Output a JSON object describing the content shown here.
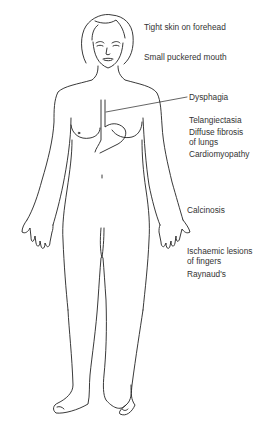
{
  "figure": {
    "line_color": "#222222",
    "background": "#ffffff"
  },
  "labels": [
    {
      "id": "forehead",
      "text": "Tight skin on forehead",
      "x": 144,
      "y": 22
    },
    {
      "id": "mouth",
      "text": "Small puckered mouth",
      "x": 144,
      "y": 52
    },
    {
      "id": "dysphagia",
      "text": "Dysphagia",
      "x": 189,
      "y": 95
    },
    {
      "id": "telangiectasia",
      "text": "Telangiectasia",
      "x": 189,
      "y": 117
    },
    {
      "id": "fibrosis-1",
      "text": "Diffuse fibrosis",
      "x": 189,
      "y": 128
    },
    {
      "id": "fibrosis-2",
      "text": "of lungs",
      "x": 189,
      "y": 138
    },
    {
      "id": "cardiomyopathy",
      "text": "Cardiomyopathy",
      "x": 189,
      "y": 150
    },
    {
      "id": "calcinosis",
      "text": "Calcinosis",
      "x": 187,
      "y": 205
    },
    {
      "id": "ischaemic-1",
      "text": "Ischaemic lesions",
      "x": 187,
      "y": 245
    },
    {
      "id": "ischaemic-2",
      "text": "of fingers",
      "x": 187,
      "y": 256
    },
    {
      "id": "raynauds",
      "text": "Raynaud's",
      "x": 187,
      "y": 269
    }
  ]
}
